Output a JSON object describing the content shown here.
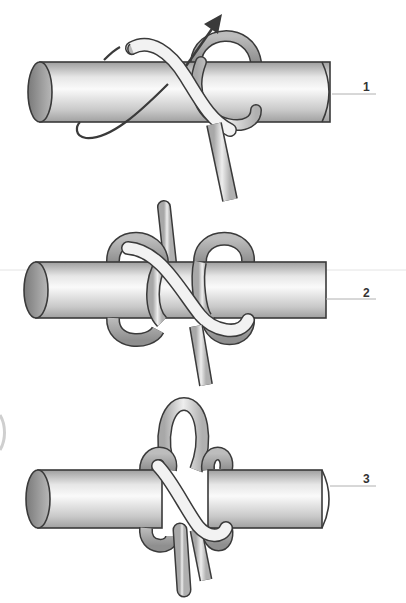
{
  "diagram": {
    "title": "",
    "steps": [
      {
        "id": 1,
        "label": "1"
      },
      {
        "id": 2,
        "label": "2"
      },
      {
        "id": 3,
        "label": "3"
      }
    ],
    "colors": {
      "outline": "#3a3a3a",
      "rope_dark": "#9a9a9a",
      "rope_light": "#f2f2f2",
      "pole_light": "#f0f0f0",
      "pole_dark": "#a8a8a8",
      "leader_line": "#b0b0b0",
      "arrow": "#3a3a3a"
    }
  }
}
